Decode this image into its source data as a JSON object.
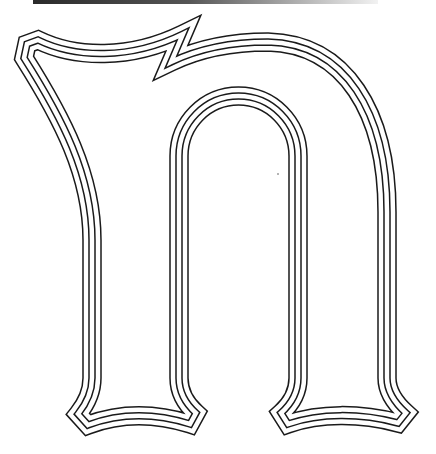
{
  "figure": {
    "glyph": "n"
  },
  "colors": {
    "background": "#ffffff",
    "ink": "#1a1a1a",
    "bar_start": "#2a2a2a",
    "bar_end": "#f2f2f2"
  },
  "top_bar": {
    "x": 33,
    "y": 0,
    "width": 345,
    "height": 4
  },
  "letter": {
    "path": "M 78,414 C 86,404 92,392 92,378 L 92,240 C 92,175 62,118 24,58 L 27,44 L 38,40 C 75,58 130,60 183,34 L 171,62 C 200,48 235,42 268,42 C 345,44 387,112 387,212 L 387,378 C 387,392 396,404 406,413 L 398,423 C 360,413 320,413 288,424 L 281,413 C 291,404 298,392 298,378 L 298,156 A 59.5,60 0 0 0 179,156 L 179,378 C 179,392 186,404 196,413 L 190,424 C 155,413 120,413 88,425 Z",
    "stroke_outer_width": 19.5,
    "gap_outer_width": 16.5,
    "stroke_inner_width": 7.5,
    "gap_inner_width": 4.5
  },
  "speck": {
    "cx": 278,
    "cy": 174,
    "r": 0.8
  }
}
